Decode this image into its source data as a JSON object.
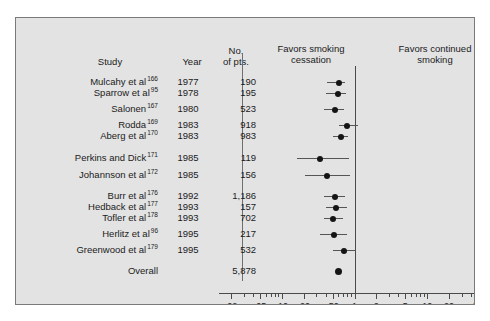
{
  "figure": {
    "background": "#e3e3e3",
    "border_color": "#7a7a7a",
    "marker_color": "#151515",
    "line_color": "#555555",
    "null_line_color": "#4a4a4a"
  },
  "headers": {
    "study": "Study",
    "year": "Year",
    "pts_line1": "No.",
    "pts_line2": "of pts.",
    "favors_left_line1": "Favors smoking",
    "favors_left_line2": "cessation",
    "favors_right_line1": "Favors continued",
    "favors_right_line2": "smoking"
  },
  "chart_data": {
    "type": "forest",
    "title": "",
    "xlabel": "",
    "ylabel": "",
    "xscale": "log",
    "xlim": [
      0.02,
      50
    ],
    "null_value": 1,
    "grid": false,
    "tick_labels": [
      ".02",
      ".05",
      ".10",
      ".20",
      ".50",
      "1",
      "2",
      "5",
      "10",
      "20",
      "50"
    ],
    "tick_values": [
      0.02,
      0.05,
      0.1,
      0.2,
      0.5,
      1,
      2,
      5,
      10,
      20,
      50
    ],
    "minor_tick_values": [
      0.03,
      0.04,
      0.06,
      0.07,
      0.08,
      0.09,
      0.3,
      0.4,
      0.6,
      0.7,
      0.8,
      0.9,
      3,
      4,
      6,
      7,
      8,
      9,
      30,
      40
    ],
    "columns": [
      "Study",
      "Year",
      "No. of pts."
    ],
    "rows": [
      {
        "study": "Mulcahy et al",
        "ref": "166",
        "year": "1977",
        "pts": "190",
        "est": 0.62,
        "lo": 0.42,
        "hi": 0.74
      },
      {
        "study": "Sparrow et al",
        "ref": "95",
        "year": "1978",
        "pts": "195",
        "est": 0.6,
        "lo": 0.4,
        "hi": 0.76
      },
      {
        "study": "Salonen",
        "ref": "167",
        "year": "1980",
        "pts": "523",
        "est": 0.54,
        "lo": 0.38,
        "hi": 0.72
      },
      {
        "study": "Rodda",
        "ref": "169",
        "year": "1983",
        "pts": "918",
        "est": 0.8,
        "lo": 0.62,
        "hi": 1.1
      },
      {
        "study": "Aberg et al",
        "ref": "170",
        "year": "1983",
        "pts": "983",
        "est": 0.65,
        "lo": 0.5,
        "hi": 0.82
      },
      {
        "study": "Perkins and Dick",
        "ref": "171",
        "year": "1985",
        "pts": "119",
        "est": 0.33,
        "lo": 0.16,
        "hi": 0.85
      },
      {
        "study": "Johannson et al",
        "ref": "172",
        "year": "1985",
        "pts": "156",
        "est": 0.42,
        "lo": 0.21,
        "hi": 0.86
      },
      {
        "study": "Burr et al",
        "ref": "176",
        "year": "1992",
        "pts": "1,186",
        "est": 0.54,
        "lo": 0.38,
        "hi": 0.75
      },
      {
        "study": "Hedback et al",
        "ref": "177",
        "year": "1993",
        "pts": "157",
        "est": 0.56,
        "lo": 0.4,
        "hi": 0.8
      },
      {
        "study": "Tofler et al",
        "ref": "178",
        "year": "1993",
        "pts": "702",
        "est": 0.5,
        "lo": 0.38,
        "hi": 0.7
      },
      {
        "study": "Herlitz et al",
        "ref": "96",
        "year": "1995",
        "pts": "217",
        "est": 0.52,
        "lo": 0.33,
        "hi": 0.8
      },
      {
        "study": "Greenwood et al",
        "ref": "179",
        "year": "1995",
        "pts": "532",
        "est": 0.72,
        "lo": 0.5,
        "hi": 1.05
      },
      {
        "study": "Overall",
        "ref": "",
        "year": "",
        "pts": "5,878",
        "est": 0.6,
        "lo": null,
        "hi": null,
        "summary": true
      }
    ]
  }
}
